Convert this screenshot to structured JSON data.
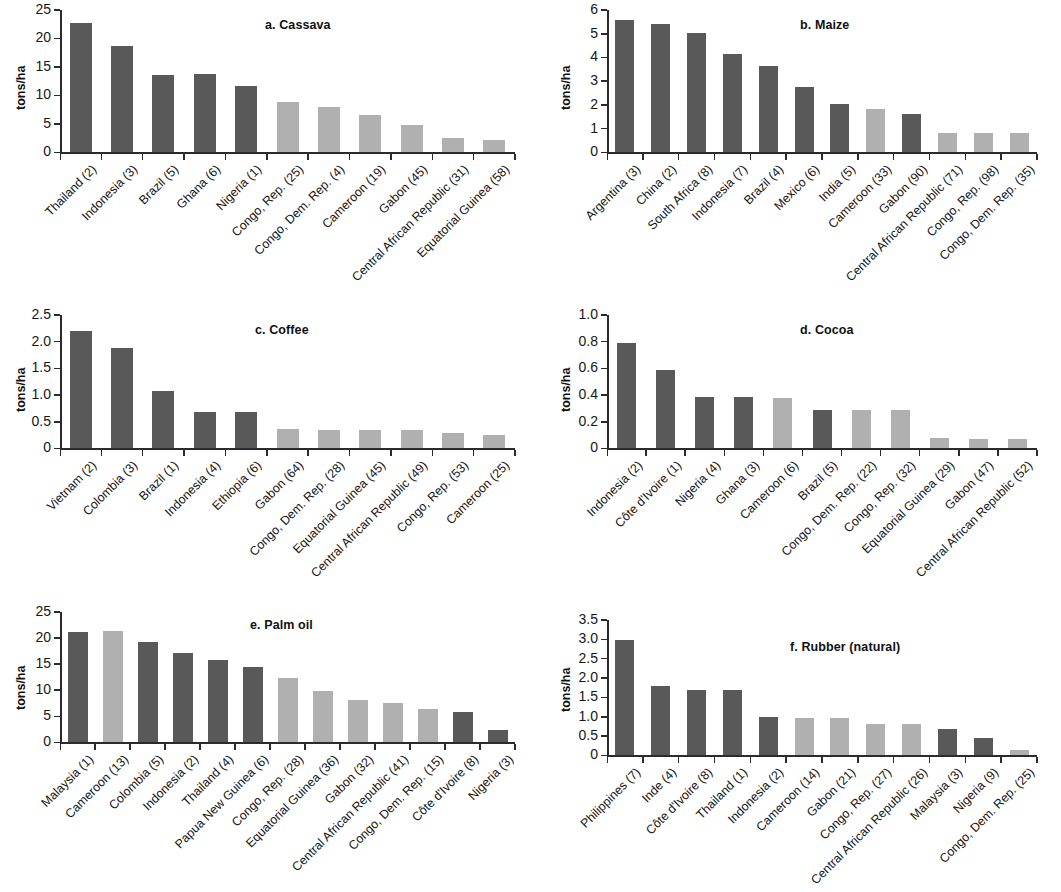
{
  "figure": {
    "ylabel": "tons/ha",
    "bar_colors": {
      "dark": "#595959",
      "light": "#b0b0b0"
    }
  },
  "chart_data": [
    {
      "id": "a",
      "type": "bar",
      "title": "a. Cassava",
      "xlabel": "",
      "ylabel": "tons/ha",
      "ylim": [
        0,
        25
      ],
      "yticks": [
        0,
        5,
        10,
        15,
        20,
        25
      ],
      "ytick_labels": [
        "0",
        "5",
        "10",
        "15",
        "20",
        "25"
      ],
      "grid": false,
      "legend": "none",
      "categories": [
        "Thailand (2)",
        "Indonesia (3)",
        "Brazil (5)",
        "Ghana (6)",
        "Nigeria (1)",
        "Congo, Rep. (25)",
        "Congo, Dem. Rep. (4)",
        "Cameroon (19)",
        "Gabon (45)",
        "Central African Republic (31)",
        "Equatorial Guinea (58)"
      ],
      "values": [
        22.7,
        18.7,
        13.6,
        13.7,
        11.6,
        8.9,
        7.9,
        6.6,
        4.8,
        2.6,
        2.1
      ],
      "colors": [
        "dark",
        "dark",
        "dark",
        "dark",
        "dark",
        "light",
        "light",
        "light",
        "light",
        "light",
        "light"
      ]
    },
    {
      "id": "b",
      "type": "bar",
      "title": "b. Maize",
      "xlabel": "",
      "ylabel": "tons/ha",
      "ylim": [
        0,
        6
      ],
      "yticks": [
        0,
        1,
        2,
        3,
        4,
        5,
        6
      ],
      "ytick_labels": [
        "0",
        "1",
        "2",
        "3",
        "4",
        "5",
        "6"
      ],
      "grid": false,
      "legend": "none",
      "categories": [
        "Argentina (3)",
        "China (2)",
        "South Africa (8)",
        "Indonesia (7)",
        "Brazil (4)",
        "Mexico (6)",
        "India (5)",
        "Cameroon (33)",
        "Gabon (90)",
        "Central African Republic (71)",
        "Congo, Rep. (98)",
        "Congo, Dem. Rep. (35)"
      ],
      "values": [
        5.6,
        5.4,
        5.05,
        4.15,
        3.65,
        2.75,
        2.05,
        1.85,
        1.6,
        0.8,
        0.8,
        0.8
      ],
      "colors": [
        "dark",
        "dark",
        "dark",
        "dark",
        "dark",
        "dark",
        "dark",
        "light",
        "dark",
        "light",
        "light",
        "light"
      ]
    },
    {
      "id": "c",
      "type": "bar",
      "title": "c. Coffee",
      "xlabel": "",
      "ylabel": "tons/ha",
      "ylim": [
        0,
        2.5
      ],
      "yticks": [
        0,
        0.5,
        1.0,
        1.5,
        2.0,
        2.5
      ],
      "ytick_labels": [
        "0",
        "0.5",
        "1.0",
        "1.5",
        "2.0",
        "2.5"
      ],
      "grid": false,
      "legend": "none",
      "categories": [
        "Vietnam (2)",
        "Colombia (3)",
        "Brazil (1)",
        "Indonesia (4)",
        "Ethiopia (6)",
        "Gabon (64)",
        "Congo, Dem. Rep. (28)",
        "Equatorial Guinea (45)",
        "Central African Republic (49)",
        "Congo, Rep. (53)",
        "Cameroon (25)"
      ],
      "values": [
        2.2,
        1.88,
        1.08,
        0.68,
        0.68,
        0.37,
        0.35,
        0.35,
        0.35,
        0.28,
        0.26
      ],
      "colors": [
        "dark",
        "dark",
        "dark",
        "dark",
        "dark",
        "light",
        "light",
        "light",
        "light",
        "light",
        "light"
      ]
    },
    {
      "id": "d",
      "type": "bar",
      "title": "d. Cocoa",
      "xlabel": "",
      "ylabel": "tons/ha",
      "ylim": [
        0,
        1.0
      ],
      "yticks": [
        0,
        0.2,
        0.4,
        0.6,
        0.8,
        1.0
      ],
      "ytick_labels": [
        "0",
        "0.2",
        "0.4",
        "0.6",
        "0.8",
        "1.0"
      ],
      "grid": false,
      "legend": "none",
      "categories": [
        "Indonesia (2)",
        "Côte d'Ivoire (1)",
        "Nigeria (4)",
        "Ghana (3)",
        "Cameroon (6)",
        "Brazil (5)",
        "Congo, Dem. Rep. (22)",
        "Congo, Rep. (32)",
        "Equatorial Guinea (29)",
        "Gabon (47)",
        "Central African Republic (52)"
      ],
      "values": [
        0.79,
        0.59,
        0.385,
        0.385,
        0.38,
        0.29,
        0.29,
        0.29,
        0.08,
        0.07,
        0.07
      ],
      "colors": [
        "dark",
        "dark",
        "dark",
        "dark",
        "light",
        "dark",
        "light",
        "light",
        "light",
        "light",
        "light"
      ]
    },
    {
      "id": "e",
      "type": "bar",
      "title": "e. Palm oil",
      "xlabel": "",
      "ylabel": "tons/ha",
      "ylim": [
        0,
        25
      ],
      "yticks": [
        0,
        5,
        10,
        15,
        20,
        25
      ],
      "ytick_labels": [
        "0",
        "5",
        "10",
        "15",
        "20",
        "25"
      ],
      "grid": false,
      "legend": "none",
      "categories": [
        "Malaysia (1)",
        "Cameroon (13)",
        "Colombia (5)",
        "Indonesia (2)",
        "Thailand (4)",
        "Papua New Guinea (6)",
        "Congo, Rep. (28)",
        "Equatorial Guinea (36)",
        "Gabon (32)",
        "Central African Republic (41)",
        "Congo, Dem. Rep. (15)",
        "Côte d'Ivoire (8)",
        "Nigeria (3)"
      ],
      "values": [
        21.1,
        21.3,
        19.3,
        17.2,
        15.8,
        14.4,
        12.4,
        9.9,
        8.1,
        7.6,
        6.5,
        5.8,
        2.4
      ],
      "colors": [
        "dark",
        "light",
        "dark",
        "dark",
        "dark",
        "dark",
        "light",
        "light",
        "light",
        "light",
        "light",
        "dark",
        "dark"
      ]
    },
    {
      "id": "f",
      "type": "bar",
      "title": "f. Rubber (natural)",
      "xlabel": "",
      "ylabel": "tons/ha",
      "ylim": [
        0,
        3.5
      ],
      "yticks": [
        0,
        0.5,
        1.0,
        1.5,
        2.0,
        2.5,
        3.0,
        3.5
      ],
      "ytick_labels": [
        "0",
        "0.5",
        "1.0",
        "1.5",
        "2.0",
        "2.5",
        "3.0",
        "3.5"
      ],
      "grid": false,
      "legend": "none",
      "categories": [
        "Philippines (7)",
        "Inde (4)",
        "Côte d'Ivoire (8)",
        "Thailand (1)",
        "Indonesia (2)",
        "Cameroon (14)",
        "Gabon (21)",
        "Congo, Rep. (27)",
        "Central African Republic (26)",
        "Malaysia (3)",
        "Nigeria (9)",
        "Congo, Dem. Rep. (25)"
      ],
      "values": [
        2.98,
        1.79,
        1.68,
        1.68,
        0.99,
        0.98,
        0.97,
        0.8,
        0.8,
        0.68,
        0.44,
        0.15
      ],
      "colors": [
        "dark",
        "dark",
        "dark",
        "dark",
        "dark",
        "light",
        "light",
        "light",
        "light",
        "dark",
        "dark",
        "light"
      ]
    }
  ]
}
